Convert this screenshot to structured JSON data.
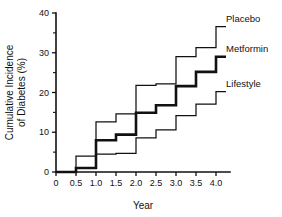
{
  "chart_data": {
    "type": "line",
    "title": "",
    "xlabel": "Year",
    "ylabel": "Cumulative Incidence of Diabetes (%)",
    "ylabel_line1": "Cumulative Incidence",
    "ylabel_line2": "of Diabetes (%)",
    "xlim": [
      0,
      4.35
    ],
    "ylim": [
      0,
      40
    ],
    "grid": false,
    "step_style": "post",
    "legend_position": "inline-right",
    "xticks": [
      0,
      0.5,
      1.0,
      1.5,
      2.0,
      2.5,
      3.0,
      3.5,
      4.0
    ],
    "xtick_labels": [
      "0",
      "0.5",
      "1.0",
      "1.5",
      "2.0",
      "2.5",
      "3.0",
      "3.5",
      "4.0"
    ],
    "yticks": [
      0,
      10,
      20,
      30,
      40
    ],
    "ytick_labels": [
      "0",
      "10",
      "20",
      "30",
      "40"
    ],
    "yticks_minor": [
      5,
      15,
      25,
      35
    ],
    "x": [
      0,
      0.5,
      1.0,
      1.5,
      2.0,
      2.5,
      3.0,
      3.5,
      4.0,
      4.25
    ],
    "series": [
      {
        "name": "Placebo",
        "label": "Placebo",
        "line_weight": "thin",
        "color": "#111111",
        "values": [
          0,
          4.0,
          12.6,
          14.6,
          21.8,
          22.2,
          29.0,
          31.3,
          36.6,
          36.6
        ]
      },
      {
        "name": "Metformin",
        "label": "Metformin",
        "line_weight": "bold",
        "color": "#111111",
        "values": [
          0,
          1.0,
          8.0,
          9.4,
          14.9,
          16.8,
          21.6,
          25.2,
          29.0,
          29.0
        ]
      },
      {
        "name": "Lifestyle",
        "label": "Lifestyle",
        "line_weight": "thin",
        "color": "#111111",
        "values": [
          0,
          1.0,
          4.5,
          4.7,
          8.6,
          10.6,
          14.2,
          17.1,
          20.2,
          20.2
        ]
      }
    ],
    "annotations": [
      {
        "text": "Placebo",
        "x": 4.0,
        "y": 36.6
      },
      {
        "text": "Metformin",
        "x": 4.0,
        "y": 29.0
      },
      {
        "text": "Lifestyle",
        "x": 4.0,
        "y": 20.2
      }
    ]
  }
}
